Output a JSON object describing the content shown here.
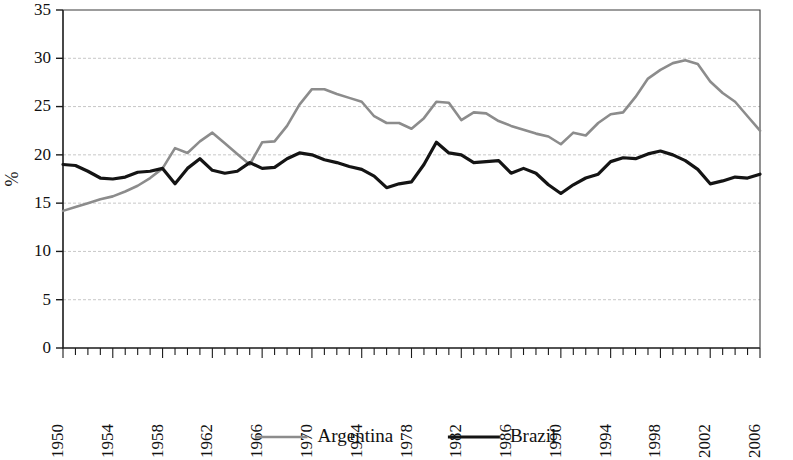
{
  "chart_data": {
    "type": "line",
    "title": "",
    "xlabel": "",
    "ylabel": "%",
    "ylim": [
      0,
      35
    ],
    "ytick_step": 5,
    "yticks": [
      0,
      5,
      10,
      15,
      20,
      25,
      30,
      35
    ],
    "ytick_labels": [
      "0",
      "5",
      "10",
      "15",
      "20",
      "25",
      "30",
      "35"
    ],
    "xlim": [
      1950,
      2006
    ],
    "xticks": [
      1950,
      1954,
      1958,
      1962,
      1966,
      1970,
      1974,
      1978,
      1982,
      1986,
      1990,
      1994,
      1998,
      2002,
      2006
    ],
    "xtick_labels": [
      "1950",
      "1954",
      "1958",
      "1962",
      "1966",
      "1970",
      "1974",
      "1978",
      "1982",
      "1986",
      "1990",
      "1994",
      "1998",
      "2002",
      "2006"
    ],
    "xtick_minor_step": 1,
    "xtick_label_rotation": -90,
    "grid": "horizontal",
    "legend_position": "bottom",
    "x": [
      1950,
      1951,
      1952,
      1953,
      1954,
      1955,
      1956,
      1957,
      1958,
      1959,
      1960,
      1961,
      1962,
      1963,
      1964,
      1965,
      1966,
      1967,
      1968,
      1969,
      1970,
      1971,
      1972,
      1973,
      1974,
      1975,
      1976,
      1977,
      1978,
      1979,
      1980,
      1981,
      1982,
      1983,
      1984,
      1985,
      1986,
      1987,
      1988,
      1989,
      1990,
      1991,
      1992,
      1993,
      1994,
      1995,
      1996,
      1997,
      1998,
      1999,
      2000,
      2001,
      2002,
      2003,
      2004,
      2005,
      2006
    ],
    "series": [
      {
        "name": "Argentina",
        "color": "#8c8c8c",
        "width": 2.6,
        "values": [
          14.2,
          14.6,
          15.0,
          15.4,
          15.7,
          16.2,
          16.8,
          17.6,
          18.6,
          20.7,
          20.2,
          21.4,
          22.3,
          21.2,
          20.1,
          19.0,
          21.3,
          21.4,
          23.0,
          25.2,
          26.8,
          26.8,
          26.3,
          25.9,
          25.5,
          24.0,
          23.3,
          23.3,
          22.7,
          23.8,
          25.5,
          25.4,
          23.6,
          24.4,
          24.3,
          23.5,
          23.0,
          22.6,
          22.2,
          21.9,
          21.1,
          22.3,
          22.0,
          23.3,
          24.2,
          24.4,
          26.0,
          27.9,
          28.8,
          29.5,
          29.8,
          29.4,
          27.6,
          26.4,
          25.5,
          24.0,
          22.5
        ]
      },
      {
        "name": "Brazil",
        "color": "#141414",
        "width": 3.2,
        "values": [
          19.0,
          18.9,
          18.3,
          17.6,
          17.5,
          17.7,
          18.2,
          18.3,
          18.6,
          17.0,
          18.6,
          19.6,
          18.4,
          18.1,
          18.3,
          19.2,
          18.6,
          18.7,
          19.6,
          20.2,
          20.0,
          19.5,
          19.2,
          18.8,
          18.5,
          17.8,
          16.6,
          17.0,
          17.2,
          19.0,
          21.3,
          20.2,
          20.0,
          19.2,
          19.3,
          19.4,
          18.1,
          18.6,
          18.1,
          16.9,
          16.0,
          16.9,
          17.6,
          18.0,
          19.3,
          19.7,
          19.6,
          20.1,
          20.4,
          20.0,
          19.4,
          18.5,
          17.0,
          17.3,
          17.7,
          17.6,
          18.0
        ]
      }
    ],
    "legend": [
      {
        "label": "Argentina",
        "color": "#8c8c8c",
        "width": 2.6
      },
      {
        "label": "Brazil",
        "color": "#141414",
        "width": 3.2
      }
    ]
  }
}
